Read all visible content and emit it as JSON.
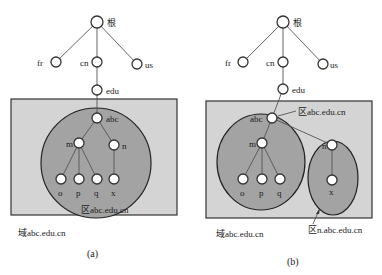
{
  "colors": {
    "domain_fill": "#d4d4d4",
    "zone_fill": "#a3a3a3",
    "node_fill": "#ffffff",
    "stroke": "#333333"
  },
  "diagram_a": {
    "caption": "(a)",
    "nodes": {
      "root": "根",
      "fr": "fr",
      "cn": "cn",
      "us": "us",
      "edu": "edu",
      "abc": "abc",
      "m": "m",
      "n": "n",
      "o": "o",
      "p": "p",
      "q": "q",
      "x": "x"
    },
    "zone_label": "区abc.edu.cn",
    "domain_label": "域abc.edu.cn"
  },
  "diagram_b": {
    "caption": "(b)",
    "nodes": {
      "root": "根",
      "fr": "fr",
      "cn": "cn",
      "us": "us",
      "edu": "edu",
      "abc": "abc",
      "m": "m",
      "n": "n",
      "o": "o",
      "p": "p",
      "q": "q",
      "x": "x"
    },
    "zone_label_main": "区abc.edu.cn",
    "zone_label_sub": "区n.abc.edu.cn",
    "domain_label": "域abc.edu.cn"
  }
}
